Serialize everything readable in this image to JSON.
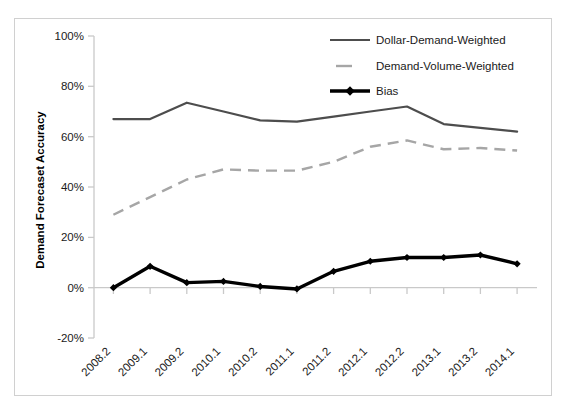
{
  "chart_data": {
    "type": "line",
    "title": "",
    "xlabel": "",
    "ylabel": "Demand Forecaset Accuracy",
    "categories": [
      "2008.2",
      "2009.1",
      "2009.2",
      "2010.1",
      "2010.2",
      "2011.1",
      "2011.2",
      "2012.1",
      "2012.2",
      "2013.1",
      "2013.2",
      "2014.1"
    ],
    "ytick_labels": [
      "100%",
      "80%",
      "60%",
      "40%",
      "20%",
      "0%",
      "-20%"
    ],
    "ytick_values": [
      100,
      80,
      60,
      40,
      20,
      0,
      -20
    ],
    "ylim": [
      -20,
      100
    ],
    "grid": false,
    "legend_position": "top-right",
    "series": [
      {
        "name": "Dollar-Demand-Weighted",
        "color": "#4d4d4d",
        "style": "solid",
        "marker": "none",
        "values": [
          67,
          67,
          73.5,
          70,
          66.5,
          66,
          68,
          70,
          72,
          65,
          63.5,
          62
        ]
      },
      {
        "name": "Demand-Volume-Weighted",
        "color": "#a6a6a6",
        "style": "dashed",
        "marker": "none",
        "values": [
          29,
          36,
          43,
          47,
          46.5,
          46.5,
          50,
          56,
          58.5,
          55,
          55.5,
          54.5
        ]
      },
      {
        "name": "Bias",
        "color": "#000000",
        "style": "solid",
        "marker": "diamond",
        "values": [
          0,
          8.5,
          2,
          2.5,
          0.5,
          -0.5,
          6.5,
          10.5,
          12,
          12,
          13,
          9.5
        ]
      }
    ]
  },
  "legend": {
    "items": [
      {
        "label": "Dollar-Demand-Weighted"
      },
      {
        "label": "Demand-Volume-Weighted"
      },
      {
        "label": "Bias"
      }
    ]
  },
  "axis": {
    "y_title": "Demand Forecaset Accuracy"
  },
  "ghost": {
    "cropped_caption": ""
  }
}
